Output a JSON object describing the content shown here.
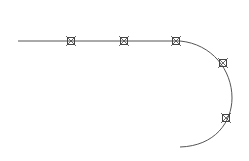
{
  "diagram": {
    "width": 249,
    "height": 161,
    "background": "#ffffff",
    "stroke_color": "#555555",
    "marker_color": "#444444",
    "path": {
      "line_start": [
        18,
        41
      ],
      "line_end": [
        180,
        41
      ],
      "arc_path": "M180 41 C 212 44, 232 70, 232 98 C 232 122, 215 146, 180 147"
    },
    "markers": [
      {
        "id": 1,
        "x": 71,
        "y": 41
      },
      {
        "id": 2,
        "x": 124,
        "y": 41
      },
      {
        "id": 3,
        "x": 176,
        "y": 41
      },
      {
        "id": 4,
        "x": 223,
        "y": 63
      },
      {
        "id": 5,
        "x": 226,
        "y": 118
      }
    ],
    "marker_size": 10
  }
}
